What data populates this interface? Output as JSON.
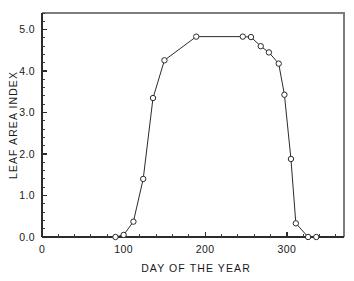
{
  "chart_data": {
    "type": "line",
    "title": "",
    "xlabel": "DAY OF THE YEAR",
    "ylabel": "LEAF AREA INDEX",
    "xlim": [
      0,
      370
    ],
    "ylim": [
      0.0,
      5.4
    ],
    "grid": false,
    "legend": null,
    "xticks": [
      0,
      100,
      200,
      300
    ],
    "xtick_labels": [
      "0",
      "100",
      "200",
      "300"
    ],
    "xminor_step": 20,
    "yticks": [
      0.0,
      1.0,
      2.0,
      3.0,
      4.0,
      5.0
    ],
    "ytick_labels": [
      "0.0",
      "1.0",
      "2.0",
      "3.0",
      "4.0",
      "5.0"
    ],
    "yminor_step": 0.2,
    "marker": "open-circle",
    "series": [
      {
        "name": "Leaf area index",
        "color": "#2b2b2b",
        "x": [
          90,
          100,
          112,
          124,
          136,
          150,
          189,
          246,
          256,
          268,
          278,
          290,
          297,
          305,
          311,
          326,
          336
        ],
        "y": [
          0.0,
          0.05,
          0.37,
          1.4,
          3.35,
          4.26,
          4.83,
          4.83,
          4.82,
          4.6,
          4.45,
          4.18,
          3.43,
          1.88,
          0.33,
          0.0,
          0.0
        ]
      }
    ]
  }
}
